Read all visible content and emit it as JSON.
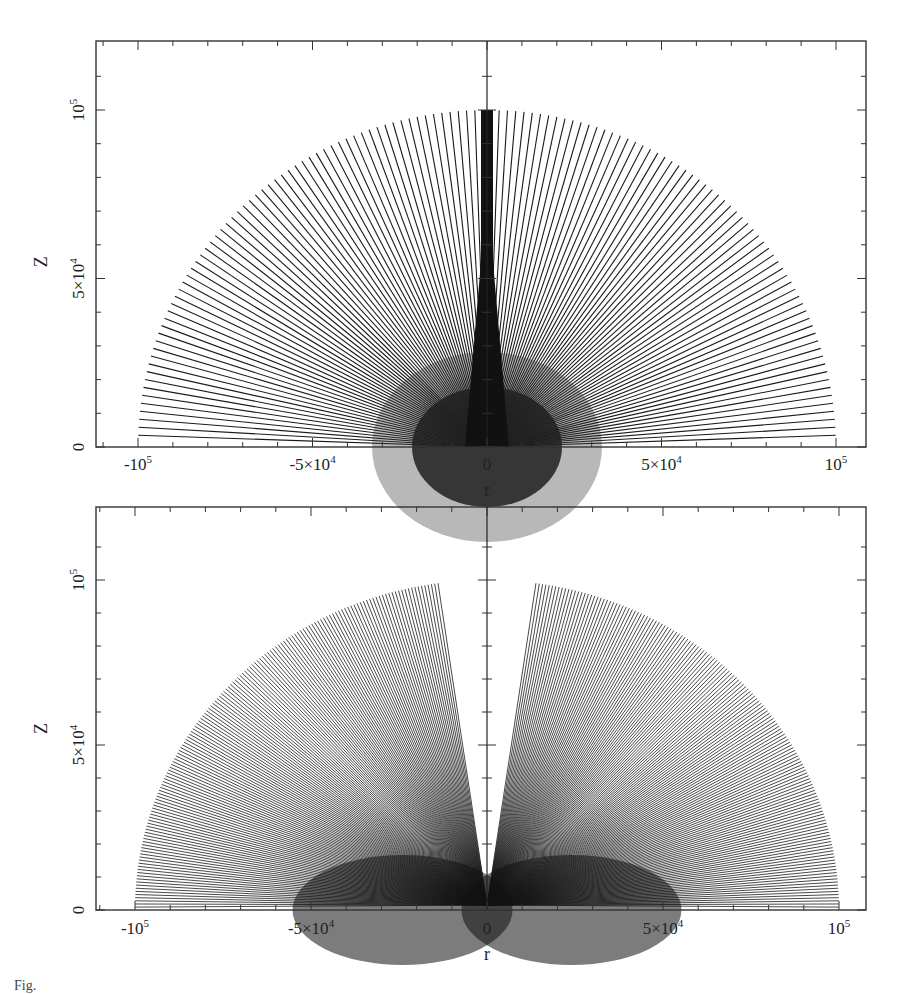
{
  "chart_data": [
    {
      "type": "line",
      "title": "",
      "panel": "top",
      "xlabel": "r",
      "ylabel": "Z",
      "xlim": [
        -118000,
        109000
      ],
      "ylim": [
        0,
        110000
      ],
      "x_ticks": [
        {
          "value": -100000,
          "label": "-10",
          "sup": "5"
        },
        {
          "value": -50000,
          "label": "-5×10",
          "sup": "4"
        },
        {
          "value": 0,
          "label": "0",
          "sup": ""
        },
        {
          "value": 50000,
          "label": "5×10",
          "sup": "4"
        },
        {
          "value": 100000,
          "label": "10",
          "sup": "5"
        }
      ],
      "y_ticks": [
        {
          "value": 0,
          "label": "0",
          "sup": ""
        },
        {
          "value": 50000,
          "label": "5×10",
          "sup": "4"
        },
        {
          "value": 100000,
          "label": "10",
          "sup": "5"
        }
      ],
      "grid": false,
      "description": "Fan of radial field lines from origin to radius 1e5; rays concentrated near the vertical axis (dense central column), terminating on a semicircle of radius 1e5",
      "rays": {
        "count": 121,
        "radius": 100000,
        "angle_min_deg": 2,
        "angle_max_deg": 178,
        "central_concentration": true
      }
    },
    {
      "type": "line",
      "title": "",
      "panel": "bottom",
      "xlabel": "r",
      "ylabel": "Z",
      "xlim": [
        -118000,
        109000
      ],
      "ylim": [
        0,
        110000
      ],
      "x_ticks": [
        {
          "value": -100000,
          "label": "-10",
          "sup": "5"
        },
        {
          "value": -50000,
          "label": "-5×10",
          "sup": "4"
        },
        {
          "value": 0,
          "label": "0",
          "sup": ""
        },
        {
          "value": 50000,
          "label": "5×10",
          "sup": "4"
        },
        {
          "value": 100000,
          "label": "10",
          "sup": "5"
        }
      ],
      "y_ticks": [
        {
          "value": 0,
          "label": "0",
          "sup": ""
        },
        {
          "value": 50000,
          "label": "5×10",
          "sup": "4"
        },
        {
          "value": 100000,
          "label": "10",
          "sup": "5"
        }
      ],
      "grid": false,
      "description": "Fan of radial field lines from origin to radius 1e5; empty cone around vertical axis (opening ~8 deg half-angle), lines dense toward the equatorial plane",
      "rays": {
        "count": 150,
        "radius": 100000,
        "angle_min_deg": 0.5,
        "angle_max_deg": 82,
        "symmetric": true
      }
    }
  ],
  "caption": "Fig. "
}
